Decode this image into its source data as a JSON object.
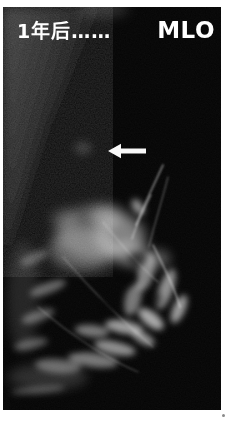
{
  "film": {
    "label_left": "1年后……",
    "label_right": "MLO",
    "text_color": "#ffffff",
    "film_background": "#000000",
    "frame_background": "#ffffff",
    "arrow_icon": "left-arrow",
    "arrow_color": "#f8f8f8"
  }
}
